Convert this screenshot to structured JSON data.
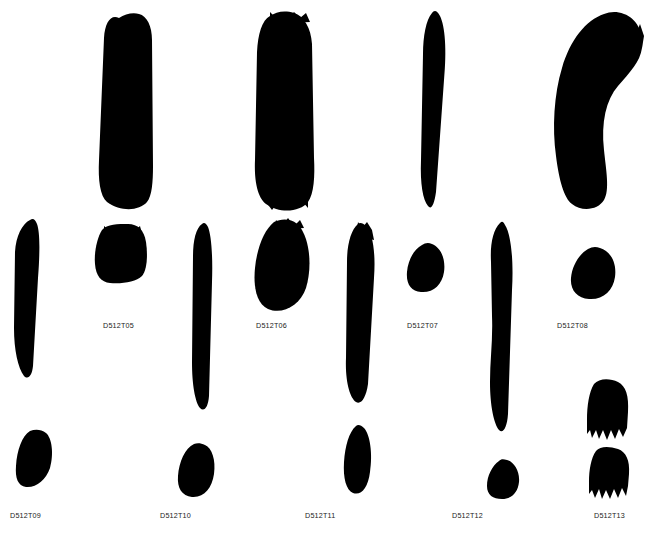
{
  "plate": {
    "width": 654,
    "height": 533,
    "background_color": "#ffffff",
    "ink_color": "#000000",
    "label_color": "#1a1a1a"
  },
  "specimens": [
    {
      "id": "D512T05",
      "label": "D512T05",
      "label_x": 103,
      "label_y": 322,
      "strokes": [
        {
          "name": "thick-vertical-slab",
          "x": 95,
          "y": 10,
          "w": 60,
          "h": 198,
          "d": "M24,8 C16,4 10,12 9,28 L4,150 C3,170 5,186 12,192 C26,202 44,201 52,192 C57,186 58,172 58,156 L57,30 C57,16 52,6 44,4 C38,2 30,4 24,8 Z"
        },
        {
          "name": "short-block-stroke",
          "x": 92,
          "y": 222,
          "w": 58,
          "h": 64,
          "d": "M10,8 C5,16 2,30 3,42 C4,54 9,60 18,61 C30,62 44,60 50,54 C55,48 56,34 54,20 C52,8 46,2 36,2 C26,2 15,2 10,8 Z"
        },
        {
          "name": "tapered-leaf-stroke",
          "x": 12,
          "y": 218,
          "w": 32,
          "h": 160,
          "d": "M18,2 C10,6 4,18 3,34 L2,110 C2,132 6,150 12,158 C16,162 20,158 21,148 L26,60 C28,34 28,14 25,6 C23,1 21,0 18,2 Z"
        },
        {
          "name": "wedge-stroke",
          "x": 14,
          "y": 428,
          "w": 40,
          "h": 62,
          "d": "M16,3 C8,8 3,22 2,38 C1,50 4,58 12,59 C22,60 32,52 36,40 C40,26 38,10 32,5 C27,1 21,1 16,3 Z"
        }
      ]
    },
    {
      "id": "D512T06",
      "label": "D512T06",
      "label_x": 256,
      "label_y": 322,
      "strokes": [
        {
          "name": "broad-ragged-slab",
          "x": 250,
          "y": 10,
          "w": 66,
          "h": 200,
          "d": "M20,6 C12,10 8,24 7,42 L5,150 C4,172 8,188 16,194 C30,204 50,202 58,192 C64,184 65,166 64,148 L62,34 C61,18 54,6 44,3 C34,0 26,2 20,6 Z"
        },
        {
          "name": "oval-blob-stroke",
          "x": 252,
          "y": 218,
          "w": 60,
          "h": 96,
          "d": "M22,4 C12,12 5,30 3,50 C1,70 5,86 16,91 C30,97 48,88 54,70 C60,50 58,26 50,12 C43,0 31,0 22,4 Z"
        },
        {
          "name": "long-thin-vertical",
          "x": 190,
          "y": 222,
          "w": 26,
          "h": 190,
          "d": "M12,2 C6,6 3,18 3,34 L2,140 C2,162 5,180 10,186 C14,190 18,186 19,174 L22,60 C23,32 21,12 18,5 C16,1 14,0 12,2 Z"
        },
        {
          "name": "small-oval-stroke",
          "x": 176,
          "y": 442,
          "w": 40,
          "h": 56,
          "d": "M18,2 C9,6 3,20 2,34 C1,46 6,54 16,55 C28,56 36,46 38,32 C40,18 36,6 29,3 C25,1 21,1 18,2 Z"
        }
      ]
    },
    {
      "id": "D512T07",
      "label": "D512T07",
      "label_x": 407,
      "label_y": 322,
      "strokes": [
        {
          "name": "pointed-tapered-vertical",
          "x": 418,
          "y": 10,
          "w": 32,
          "h": 200,
          "d": "M14,3 C8,10 5,26 5,44 L3,150 C2,174 5,190 10,196 C13,200 16,196 18,182 L26,70 C29,40 27,16 22,6 C19,0 16,0 14,3 Z"
        },
        {
          "name": "rounded-chunk-stroke",
          "x": 404,
          "y": 242,
          "w": 42,
          "h": 52,
          "d": "M18,3 C10,7 4,18 3,30 C2,42 7,49 17,50 C29,51 38,43 40,30 C42,16 36,5 28,2 C24,0 21,1 18,3 Z"
        },
        {
          "name": "curved-ribbon-stroke",
          "x": 342,
          "y": 222,
          "w": 36,
          "h": 184,
          "d": "M16,2 C9,8 5,22 5,40 L4,136 C3,160 8,176 14,180 C19,183 24,176 26,162 L32,56 C34,28 30,10 24,4 C21,1 18,0 16,2 Z"
        },
        {
          "name": "hook-stroke",
          "x": 340,
          "y": 424,
          "w": 34,
          "h": 72,
          "d": "M16,2 C9,8 5,22 4,38 C3,54 6,66 13,69 C21,72 28,64 30,48 C33,30 30,10 24,4 C21,1 18,0 16,2 Z"
        }
      ]
    },
    {
      "id": "D512T08",
      "label": "D512T08",
      "label_x": 557,
      "label_y": 322,
      "strokes": [
        {
          "name": "curved-s-sweep-stroke",
          "x": 548,
          "y": 10,
          "w": 98,
          "h": 202,
          "d": "M56,4 C38,10 22,30 14,58 C6,84 4,118 8,146 C11,170 16,188 24,194 C34,202 50,200 56,190 C62,180 58,160 56,140 C53,112 58,90 70,76 C82,62 92,52 94,38 C96,22 88,8 76,4 C68,1 62,2 56,4 Z"
        },
        {
          "name": "round-blob-stroke",
          "x": 568,
          "y": 246,
          "w": 50,
          "h": 54,
          "d": "M20,3 C11,8 4,20 3,32 C2,44 9,52 21,53 C35,54 45,45 47,31 C49,16 42,5 32,2 C27,0 24,1 20,3 Z"
        },
        {
          "name": "wavy-long-vertical",
          "x": 484,
          "y": 220,
          "w": 34,
          "h": 216,
          "d": "M16,3 C9,10 6,24 7,42 L8,96 C9,120 6,140 6,162 C6,186 10,204 15,210 C19,214 23,208 24,194 L28,70 C30,36 26,12 21,5 C19,1 18,1 16,3 Z"
        },
        {
          "name": "angular-chip-stroke",
          "x": 484,
          "y": 458,
          "w": 36,
          "h": 42,
          "d": "M15,3 C8,8 3,18 3,28 C3,37 9,41 18,41 C28,41 34,34 35,24 C36,13 30,4 23,2 C19,1 17,1 15,3 Z"
        }
      ]
    },
    {
      "id": "D512T09",
      "label": "D512T09",
      "label_x": 10,
      "label_y": 512,
      "strokes": []
    },
    {
      "id": "D512T10",
      "label": "D512T10",
      "label_x": 160,
      "label_y": 512,
      "strokes": []
    },
    {
      "id": "D512T11",
      "label": "D512T11",
      "label_x": 305,
      "label_y": 512,
      "strokes": []
    },
    {
      "id": "D512T12",
      "label": "D512T12",
      "label_x": 452,
      "label_y": 512,
      "strokes": []
    },
    {
      "id": "D512T13",
      "label": "D512T13",
      "label_x": 594,
      "label_y": 512,
      "strokes": [
        {
          "name": "bristled-block-upper",
          "x": 584,
          "y": 378,
          "w": 48,
          "h": 66,
          "d": "M10,6 C5,14 3,28 3,42 L3,56 L6,52 L8,60 L12,52 L15,61 L19,52 L23,62 L27,52 L31,61 L35,51 L39,59 L43,50 L44,34 C45,18 42,8 34,4 C26,0 15,0 10,6 Z"
        },
        {
          "name": "bristled-block-lower",
          "x": 586,
          "y": 446,
          "w": 46,
          "h": 56,
          "d": "M10,5 C5,12 3,24 3,36 L3,48 L6,44 L9,52 L13,43 L16,53 L20,44 L24,53 L28,43 L32,52 L36,42 L40,50 L42,40 L43,28 C44,14 40,6 32,3 C23,0 14,0 10,5 Z"
        }
      ]
    }
  ],
  "figure": {
    "type": "specimen-plate",
    "rows": 3,
    "columns": 5,
    "specimen_count": 9
  }
}
